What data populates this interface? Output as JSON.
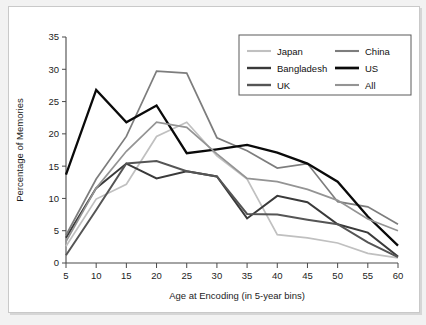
{
  "chart_data": {
    "type": "line",
    "title": "",
    "xlabel": "Age at Encoding (in 5-year bins)",
    "ylabel": "Percentage of Memories",
    "x": [
      5,
      10,
      15,
      20,
      25,
      30,
      35,
      40,
      45,
      50,
      55,
      60
    ],
    "xticklabels": [
      "5",
      "10",
      "15",
      "20",
      "25",
      "30",
      "35",
      "40",
      "45",
      "50",
      "55",
      "60"
    ],
    "yticklabels": [
      "0",
      "5",
      "10",
      "15",
      "20",
      "25",
      "30",
      "35"
    ],
    "xlim": [
      5,
      60
    ],
    "ylim": [
      0,
      35
    ],
    "grid": false,
    "legend_position": "top-right",
    "legend_columns": 2,
    "series": [
      {
        "name": "Japan",
        "color": "#c0c0c0",
        "width": 1.7,
        "values": [
          2.6,
          9.9,
          12.2,
          19.6,
          21.8,
          16.6,
          13.0,
          4.4,
          3.9,
          3.1,
          1.5,
          0.8
        ]
      },
      {
        "name": "Bangladesh",
        "color": "#3a3a3a",
        "width": 2.0,
        "values": [
          3.9,
          11.6,
          15.4,
          13.1,
          14.2,
          13.4,
          6.9,
          10.4,
          9.4,
          6.0,
          4.7,
          1.0
        ]
      },
      {
        "name": "UK",
        "color": "#555555",
        "width": 2.0,
        "values": [
          1.2,
          8.2,
          15.4,
          15.8,
          14.2,
          13.4,
          7.6,
          7.5,
          6.7,
          6.0,
          3.2,
          0.9
        ]
      },
      {
        "name": "China",
        "color": "#7d7d7d",
        "width": 1.7,
        "values": [
          4.3,
          13.0,
          19.6,
          29.7,
          29.4,
          19.4,
          17.4,
          14.7,
          15.4,
          9.5,
          8.7,
          6.0
        ]
      },
      {
        "name": "US",
        "color": "#0a0a0a",
        "width": 2.3,
        "values": [
          13.7,
          26.8,
          21.8,
          24.4,
          17.0,
          17.6,
          18.3,
          17.1,
          15.4,
          12.6,
          7.2,
          2.7
        ]
      },
      {
        "name": "All",
        "color": "#949494",
        "width": 1.7,
        "values": [
          3.3,
          11.6,
          17.3,
          21.8,
          21.0,
          16.9,
          13.1,
          12.6,
          11.4,
          9.7,
          6.8,
          5.0
        ]
      }
    ]
  },
  "legend": {
    "entries": [
      {
        "label": "Japan"
      },
      {
        "label": "China"
      },
      {
        "label": "Bangladesh"
      },
      {
        "label": "US"
      },
      {
        "label": "UK"
      },
      {
        "label": "All"
      }
    ]
  },
  "colors": {
    "background": "#f2f2f2",
    "panel": "#ffffff",
    "axis": "#4a4a4a",
    "text": "#1d1d1d"
  }
}
